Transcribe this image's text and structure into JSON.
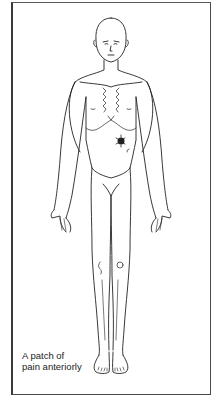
{
  "figure": {
    "caption_line1": "A patch of",
    "caption_line2": "pain anteriorly",
    "pain_patch": {
      "x": 120,
      "y": 141,
      "color": "#222222"
    }
  }
}
